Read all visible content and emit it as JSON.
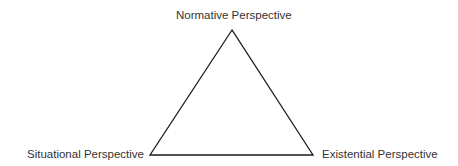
{
  "diagram": {
    "type": "triangle",
    "stroke_color": "#1a1a1a",
    "vertices": {
      "top": {
        "label": "Normative Perspective"
      },
      "bottom_left": {
        "label": "Situational Perspective"
      },
      "bottom_right": {
        "label": "Existential Perspective"
      }
    }
  }
}
